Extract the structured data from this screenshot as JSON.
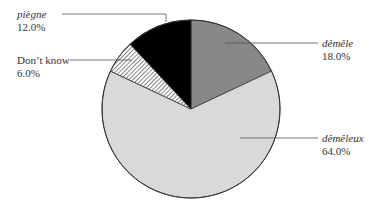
{
  "chart_data": {
    "type": "pie",
    "title": "",
    "start_angle_deg": 0,
    "direction": "clockwise",
    "slices": [
      {
        "label": "dêmêle",
        "value": 18.0,
        "display": "18.0%",
        "color": "#888888",
        "pattern": "solid",
        "italic": true
      },
      {
        "label": "dêmêleux",
        "value": 64.0,
        "display": "64.0%",
        "color": "#d9d9d9",
        "pattern": "solid",
        "italic": true
      },
      {
        "label": "Don’t know",
        "value": 6.0,
        "display": "6.0%",
        "color": "#ffffff",
        "pattern": "diagonal-hatch",
        "italic": false
      },
      {
        "label": "piègne",
        "value": 12.0,
        "display": "12.0%",
        "color": "#000000",
        "pattern": "solid",
        "italic": true
      }
    ],
    "legend": "leader-line labels"
  },
  "labels": {
    "demele": {
      "name": "dêmêle",
      "pct": "18.0%"
    },
    "demeleux": {
      "name": "dêmêleux",
      "pct": "64.0%"
    },
    "dontknow": {
      "name": "Don’t know",
      "pct": "6.0%"
    },
    "piegne": {
      "name": "piègne",
      "pct": "12.0%"
    }
  }
}
